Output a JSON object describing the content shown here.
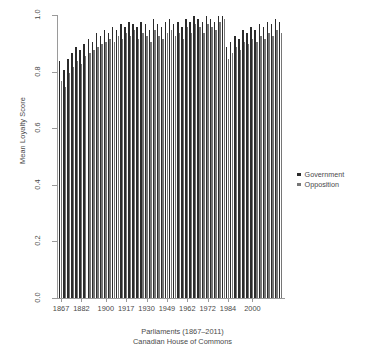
{
  "chart_data": {
    "type": "bar",
    "title": "",
    "xlabel": "Parliaments (1867–2011)",
    "xsublabel": "Canadian House of Commons",
    "ylabel": "Mean Loyalty Score",
    "ylim": [
      0.0,
      1.0
    ],
    "grid": false,
    "legend_position": "right",
    "ytick_labels": [
      "0.0",
      "0.2",
      "0.4",
      "0.6",
      "0.8",
      "1.0"
    ],
    "ytick_values": [
      0.0,
      0.2,
      0.4,
      0.6,
      0.8,
      1.0
    ],
    "xtick_labels": [
      "1867",
      "1882",
      "1900",
      "1917",
      "1930",
      "1949",
      "1962",
      "1972",
      "1984",
      "2000"
    ],
    "xtick_indices": [
      0,
      5,
      11,
      16,
      21,
      26,
      31,
      36,
      41,
      47
    ],
    "categories": [
      "1867",
      "1872",
      "1874",
      "1878",
      "1882",
      "1887",
      "1891",
      "1896",
      "1900",
      "1904",
      "1908",
      "1911",
      "1917",
      "1921",
      "1925",
      "1926",
      "1930",
      "1935",
      "1940",
      "1945",
      "1949",
      "1953",
      "1957",
      "1958",
      "1962",
      "1963",
      "1965",
      "1968",
      "1972",
      "1974",
      "1979",
      "1980",
      "1984",
      "1988",
      "1993",
      "1997",
      "2000",
      "2004",
      "2006",
      "2008",
      "2011",
      "1887b",
      "1891b",
      "1896b",
      "1900b",
      "1904b",
      "1908b",
      "1911b",
      "1917b",
      "1921b",
      "1925b",
      "1926b",
      "1930b",
      "1935b",
      "1940b"
    ],
    "series": [
      {
        "name": "Government",
        "color": "#2b2b2b",
        "values": [
          0.83,
          0.8,
          0.84,
          0.86,
          0.88,
          0.87,
          0.89,
          0.91,
          0.9,
          0.93,
          0.92,
          0.94,
          0.93,
          0.95,
          0.94,
          0.96,
          0.95,
          0.97,
          0.96,
          0.95,
          0.97,
          0.96,
          0.94,
          0.98,
          0.96,
          0.95,
          0.97,
          0.98,
          0.96,
          0.97,
          0.95,
          0.98,
          0.97,
          0.99,
          0.98,
          0.97,
          0.99,
          0.98,
          0.97,
          0.99,
          0.99,
          0.88,
          0.9,
          0.92,
          0.91,
          0.94,
          0.93,
          0.95,
          0.94,
          0.96,
          0.95,
          0.97,
          0.96,
          0.98,
          0.97
        ]
      },
      {
        "name": "Opposition",
        "color": "#767676",
        "values": [
          0.76,
          0.74,
          0.79,
          0.81,
          0.83,
          0.82,
          0.85,
          0.86,
          0.87,
          0.88,
          0.89,
          0.9,
          0.91,
          0.9,
          0.92,
          0.91,
          0.93,
          0.92,
          0.94,
          0.91,
          0.93,
          0.92,
          0.9,
          0.94,
          0.92,
          0.91,
          0.93,
          0.94,
          0.92,
          0.93,
          0.91,
          0.95,
          0.93,
          0.96,
          0.95,
          0.93,
          0.96,
          0.95,
          0.94,
          0.97,
          0.98,
          0.84,
          0.86,
          0.88,
          0.87,
          0.9,
          0.89,
          0.91,
          0.9,
          0.92,
          0.91,
          0.93,
          0.92,
          0.94,
          0.93
        ]
      }
    ]
  },
  "legend": {
    "items": [
      {
        "label": "Government",
        "color": "#2b2b2b"
      },
      {
        "label": "Opposition",
        "color": "#767676"
      }
    ]
  }
}
